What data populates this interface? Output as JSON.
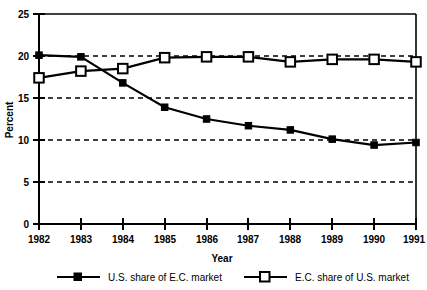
{
  "chart_data": {
    "type": "line",
    "title": "",
    "xlabel": "Year",
    "ylabel": "Percent",
    "x": [
      1982,
      1983,
      1984,
      1985,
      1986,
      1987,
      1988,
      1989,
      1990,
      1991
    ],
    "xtick_labels": [
      "1982",
      "1983",
      "1984",
      "1985",
      "1986",
      "1987",
      "1988",
      "1989",
      "1990",
      "1991"
    ],
    "ytick_labels": [
      "0",
      "5",
      "10",
      "15",
      "20",
      "25"
    ],
    "yticks": [
      0,
      5,
      10,
      15,
      20,
      25
    ],
    "ylim": [
      0,
      25
    ],
    "xlim": [
      1982,
      1991
    ],
    "grid": "horizontal-dashed at 5, 10, 15, 20",
    "legend_position": "bottom",
    "series": [
      {
        "name": "U.S. share of E.C. market",
        "marker": "filled-square",
        "color": "#000000",
        "values": [
          20.1,
          19.9,
          16.8,
          13.9,
          12.5,
          11.7,
          11.2,
          10.1,
          9.4,
          9.7
        ]
      },
      {
        "name": "E.C. share of U.S. market",
        "marker": "open-square",
        "color": "#000000",
        "values": [
          17.4,
          18.2,
          18.5,
          19.8,
          19.9,
          19.9,
          19.3,
          19.6,
          19.6,
          19.3
        ]
      }
    ]
  },
  "axis": {
    "y_title": "Percent",
    "x_title": "Year",
    "y_labels": [
      "25",
      "20",
      "15",
      "10",
      "5",
      "0"
    ],
    "x_labels": [
      "1982",
      "1983",
      "1984",
      "1985",
      "1986",
      "1987",
      "1988",
      "1989",
      "1990",
      "1991"
    ]
  },
  "legend": {
    "items": [
      {
        "label": "U.S. share of E.C. market",
        "marker": "filled-square"
      },
      {
        "label": "E.C. share of U.S. market",
        "marker": "open-square"
      }
    ]
  },
  "colors": {
    "ink": "#000000",
    "background": "#ffffff"
  }
}
